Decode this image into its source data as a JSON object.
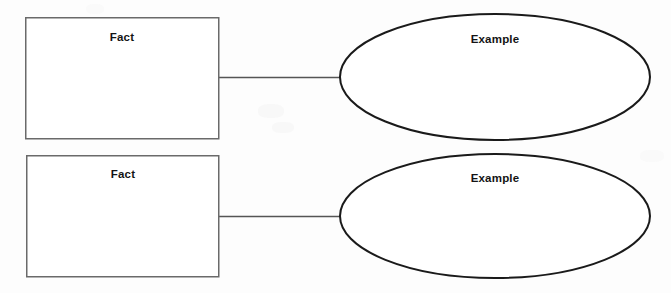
{
  "page": {
    "background_color": "#fdfdfd",
    "width": 671,
    "height": 293
  },
  "style": {
    "box_stroke_color": "#6a6a6a",
    "box_stroke_width": 1.5,
    "box_fill_color": "#ffffff",
    "ellipse_stroke_color": "#1a1a1a",
    "ellipse_stroke_width": 2,
    "ellipse_fill_color": "#ffffff",
    "connector_stroke_color": "#555555",
    "connector_stroke_width": 1.4,
    "text_color": "#141414"
  },
  "diagram": {
    "type": "fact-example-organizer",
    "rows": [
      {
        "id": "row-1",
        "fact": {
          "label": "Fact",
          "shape": "rectangle",
          "x": 25,
          "y": 17,
          "width": 194,
          "height": 122
        },
        "example": {
          "label": "Example",
          "shape": "ellipse",
          "cx": 495,
          "cy": 77,
          "rx": 155,
          "ry": 63
        },
        "connector": {
          "x1": 219,
          "y1": 77,
          "x2": 341,
          "y2": 77
        }
      },
      {
        "id": "row-2",
        "fact": {
          "label": "Fact",
          "shape": "rectangle",
          "x": 26,
          "y": 155,
          "width": 193,
          "height": 122
        },
        "example": {
          "label": "Example",
          "shape": "ellipse",
          "cx": 495,
          "cy": 216,
          "rx": 155,
          "ry": 62
        },
        "connector": {
          "x1": 219,
          "y1": 216,
          "x2": 341,
          "y2": 216
        }
      }
    ]
  }
}
